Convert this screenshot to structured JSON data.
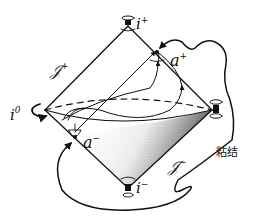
{
  "diagram": {
    "type": "conformal-compactification",
    "labels": {
      "future_timelike_infinity": "i",
      "future_timelike_sup": "+",
      "spatial_infinity": "i",
      "spatial_infinity_sup": "0",
      "past_timelike_infinity": "i",
      "past_timelike_sup": "−",
      "point_a_plus": "a",
      "point_a_plus_sup": "+",
      "point_a_minus": "a",
      "point_a_minus_sup": "−",
      "scri_plus": "𝒥",
      "scri_plus_sup": "+",
      "scri_minus": "𝒥",
      "scri_minus_sup": "−",
      "gluing": "粘结"
    },
    "colors": {
      "ink": "#111111",
      "background": "#ffffff",
      "shading": "#333333"
    }
  }
}
